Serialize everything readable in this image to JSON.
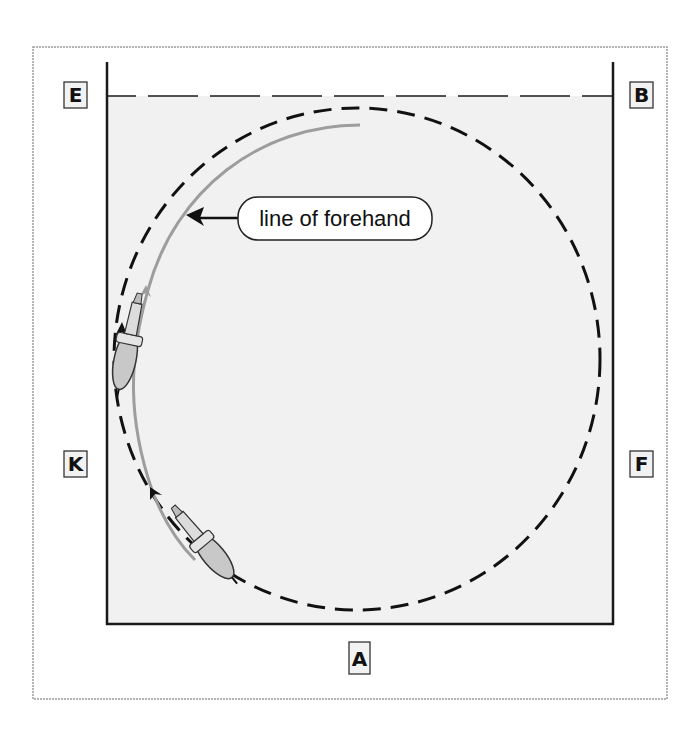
{
  "diagram": {
    "type": "arena-movement-diagram",
    "arena": {
      "fill": "#f1f1f1",
      "wall_color": "#1a1a1a",
      "frame_color": "#9a9a9a"
    },
    "markers": [
      {
        "letter": "E",
        "position": "top-left"
      },
      {
        "letter": "B",
        "position": "top-right"
      },
      {
        "letter": "K",
        "position": "left-middle"
      },
      {
        "letter": "F",
        "position": "right-middle"
      },
      {
        "letter": "A",
        "position": "bottom-center"
      }
    ],
    "paths": {
      "circle": {
        "style": "dashed",
        "color": "#111111",
        "label": "circle path"
      },
      "forehand": {
        "style": "solid",
        "color": "#9d9d9d",
        "label": "line of forehand"
      }
    },
    "callout": {
      "text": "line of forehand"
    },
    "horses": [
      {
        "name": "horse-upper",
        "location": "left wall near K-E"
      },
      {
        "name": "horse-lower",
        "location": "bottom-left near K-A"
      }
    ]
  }
}
